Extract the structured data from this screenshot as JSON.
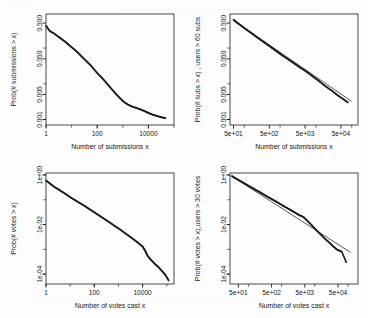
{
  "figure": {
    "background": "#ffffff",
    "ink": "#161616",
    "layout": "2x2 grid of log-log CCDF plots"
  },
  "chart_data": [
    {
      "id": "submissions-all",
      "position": "top-left",
      "type": "line",
      "title": "",
      "xlabel": "Number of submissions x",
      "ylabel": "Prob(# submissions > x)",
      "xscale": "log",
      "yscale": "log",
      "xlim": [
        1,
        100000
      ],
      "ylim": [
        0.0007,
        0.9
      ],
      "xticks": [
        1,
        100,
        10000
      ],
      "xticklabels": [
        "1",
        "100",
        "10000"
      ],
      "yticks": [
        0.5,
        0.05,
        0.005,
        0.001
      ],
      "yticklabels": [
        "0.500",
        "0.050",
        "0.005",
        "0.001"
      ],
      "grid": false,
      "legend": null,
      "has_fit_line": false,
      "series": [
        {
          "name": "empirical CCDF",
          "style": "stepped points",
          "x": [
            1,
            1.4,
            2,
            3,
            4,
            6,
            8,
            12,
            18,
            26,
            38,
            55,
            80,
            115,
            170,
            250,
            360,
            520,
            760,
            1100,
            1600,
            2300,
            3400,
            5000,
            7200,
            10500,
            15000,
            22000,
            32000,
            46000
          ],
          "y": [
            0.42,
            0.3,
            0.26,
            0.21,
            0.18,
            0.145,
            0.12,
            0.095,
            0.073,
            0.056,
            0.043,
            0.033,
            0.024,
            0.018,
            0.0135,
            0.0098,
            0.0072,
            0.0053,
            0.004,
            0.0031,
            0.0026,
            0.0023,
            0.0021,
            0.0019,
            0.0017,
            0.0015,
            0.00135,
            0.00125,
            0.00115,
            0.0011
          ]
        }
      ]
    },
    {
      "id": "submissions-heavy-users",
      "position": "top-right",
      "type": "line",
      "title": "",
      "xlabel": "Number of submissions x",
      "ylabel": "Prob(# subs > x) , users > 60 subs",
      "xscale": "log",
      "yscale": "log",
      "xlim": [
        40,
        150000
      ],
      "ylim": [
        0.0007,
        0.9
      ],
      "xticks": [
        50,
        500,
        5000,
        50000
      ],
      "xticklabels": [
        "5e+01",
        "5e+02",
        "5e+03",
        "5e+04"
      ],
      "yticks": [
        0.5,
        0.05,
        0.005,
        0.001
      ],
      "yticklabels": [
        "0.500",
        "0.050",
        "0.005",
        "0.001"
      ],
      "grid": false,
      "legend": null,
      "has_fit_line": true,
      "series": [
        {
          "name": "empirical CCDF",
          "style": "stepped points",
          "x": [
            50,
            62,
            78,
            98,
            125,
            160,
            205,
            265,
            340,
            440,
            570,
            740,
            960,
            1250,
            1650,
            2150,
            2800,
            3700,
            4900,
            6400,
            8500,
            11500,
            15500,
            21000,
            29000,
            40000,
            56000,
            78000
          ],
          "y": [
            0.62,
            0.52,
            0.44,
            0.37,
            0.31,
            0.26,
            0.215,
            0.18,
            0.15,
            0.125,
            0.104,
            0.086,
            0.071,
            0.059,
            0.049,
            0.041,
            0.034,
            0.028,
            0.0235,
            0.0195,
            0.0155,
            0.0125,
            0.0098,
            0.0078,
            0.0062,
            0.0048,
            0.0038,
            0.003
          ]
        },
        {
          "name": "power-law fit",
          "style": "straight line",
          "x": [
            50,
            100000
          ],
          "y": [
            0.6,
            0.0032
          ]
        }
      ]
    },
    {
      "id": "votes-all",
      "position": "bottom-left",
      "type": "line",
      "title": "",
      "xlabel": "Number of votes cast x",
      "ylabel": "Prob(# votes > x)",
      "xscale": "log",
      "yscale": "log",
      "xlim": [
        1,
        200000
      ],
      "ylim": [
        4e-05,
        1.2
      ],
      "xticks": [
        1,
        100,
        10000
      ],
      "xticklabels": [
        "1",
        "100",
        "10000"
      ],
      "yticks": [
        1,
        0.01,
        0.0001
      ],
      "yticklabels": [
        "1e+00",
        "1e-02",
        "1e-04"
      ],
      "grid": false,
      "legend": null,
      "has_fit_line": false,
      "series": [
        {
          "name": "empirical CCDF",
          "style": "stepped points",
          "x": [
            1,
            1.5,
            2.2,
            3.3,
            5,
            7.5,
            11,
            17,
            26,
            40,
            60,
            92,
            140,
            215,
            330,
            500,
            770,
            1200,
            1800,
            2800,
            4300,
            6600,
            10000,
            13000,
            16000,
            22000,
            32000,
            46000,
            65000,
            90000,
            120000
          ],
          "y": [
            0.6,
            0.44,
            0.33,
            0.26,
            0.2,
            0.155,
            0.12,
            0.093,
            0.072,
            0.056,
            0.043,
            0.033,
            0.025,
            0.019,
            0.0145,
            0.011,
            0.0082,
            0.0062,
            0.0046,
            0.0034,
            0.0025,
            0.0018,
            0.0013,
            0.00085,
            0.00055,
            0.00038,
            0.00026,
            0.00019,
            0.00013,
            9e-05,
            5.5e-05
          ]
        }
      ]
    },
    {
      "id": "votes-heavy-users",
      "position": "bottom-right",
      "type": "line",
      "title": "",
      "xlabel": "Number of votes cast x",
      "ylabel": "Prob(# votes > x),users > 30 votes",
      "xscale": "log",
      "yscale": "log",
      "xlim": [
        28,
        200000
      ],
      "ylim": [
        4e-05,
        1.2
      ],
      "xticks": [
        50,
        500,
        5000,
        50000
      ],
      "xticklabels": [
        "5e+01",
        "5e+02",
        "5e+03",
        "5e+04"
      ],
      "yticks": [
        1,
        0.01,
        0.0001
      ],
      "yticklabels": [
        "1e+00",
        "1e-02",
        "1e-04"
      ],
      "grid": false,
      "legend": null,
      "has_fit_line": true,
      "series": [
        {
          "name": "empirical CCDF",
          "style": "stepped points",
          "x": [
            32,
            42,
            56,
            75,
            100,
            135,
            180,
            240,
            320,
            430,
            580,
            780,
            1050,
            1400,
            1900,
            2550,
            3400,
            4600,
            6200,
            8300,
            11000,
            15000,
            20000,
            27000,
            36000,
            48000,
            65000,
            88000
          ],
          "y": [
            0.9,
            0.72,
            0.58,
            0.46,
            0.37,
            0.295,
            0.235,
            0.19,
            0.15,
            0.12,
            0.096,
            0.076,
            0.06,
            0.048,
            0.038,
            0.03,
            0.024,
            0.02,
            0.0135,
            0.009,
            0.006,
            0.004,
            0.0027,
            0.0019,
            0.0013,
            0.00095,
            0.0008,
            0.0003
          ]
        },
        {
          "name": "power-law fit",
          "style": "straight line",
          "x": [
            32,
            120000
          ],
          "y": [
            0.88,
            0.00075
          ]
        }
      ]
    }
  ]
}
